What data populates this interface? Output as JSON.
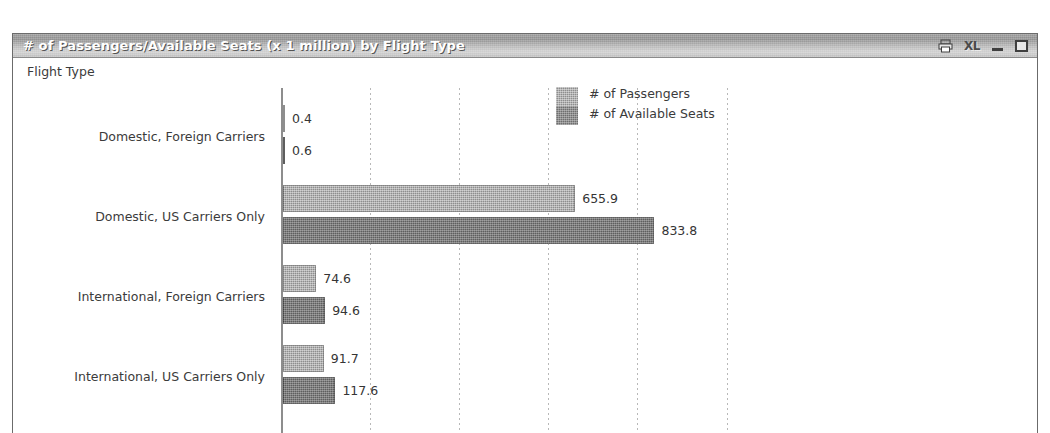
{
  "window": {
    "title": "# of Passengers/Available Seats (x 1 million) by Flight Type",
    "controls": {
      "print_icon": "printer-icon",
      "excel_label": "XL",
      "minimize_label": "",
      "maximize_label": ""
    }
  },
  "chart_data": {
    "type": "bar",
    "orientation": "horizontal",
    "title": "# of Passengers/Available Seats (x 1 million) by Flight Type",
    "xlabel": "",
    "ylabel": "Flight Type",
    "axis_title": "Flight Type",
    "grid": true,
    "grid_axis": "x",
    "legend_position": "top-right",
    "xlim": [
      0,
      900
    ],
    "gridline_values": [
      200,
      400,
      600,
      800,
      1000
    ],
    "categories": [
      "Domestic, Foreign Carriers",
      "Domestic, US Carriers Only",
      "International, Foreign Carriers",
      "International, US Carriers Only"
    ],
    "series": [
      {
        "name": "# of Passengers",
        "color": "#8e8e8e",
        "values": [
          0.4,
          655.9,
          74.6,
          91.7
        ],
        "labels": [
          "0.4",
          "655.9",
          "74.6",
          "91.7"
        ]
      },
      {
        "name": "# of Available Seats",
        "color": "#5e5e5e",
        "values": [
          0.6,
          833.8,
          94.6,
          117.6
        ],
        "labels": [
          "0.6",
          "833.8",
          "94.6",
          "117.6"
        ]
      }
    ]
  }
}
